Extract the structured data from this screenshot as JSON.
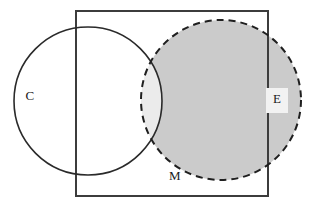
{
  "figure": {
    "type": "venn-diagram",
    "title": "",
    "background_color": "#ffffff",
    "width": 311,
    "height": 213
  },
  "universe": {
    "name": "universal-set-rectangle",
    "label": "",
    "x": 76,
    "y": 11,
    "width": 192,
    "height": 185,
    "stroke_color": "#3c3c3c",
    "stroke_width": 2,
    "fill": "none"
  },
  "sets": [
    {
      "id": "C",
      "label": "C",
      "shape": "circle",
      "cx": 88,
      "cy": 101,
      "r": 74,
      "stroke_color": "#2a2a2a",
      "stroke_width": 1.6,
      "stroke_style": "solid",
      "fill": "none",
      "label_x": 30,
      "label_y": 97
    },
    {
      "id": "M",
      "label": "M",
      "shape": "circle",
      "cx": 221,
      "cy": 100,
      "r": 80,
      "stroke_color": "#1f1f1f",
      "stroke_width": 2,
      "stroke_style": "dashed",
      "dash_pattern": "7 5",
      "fill": "#cbcbcb",
      "label_x": 175,
      "label_y": 177
    }
  ],
  "regions": [
    {
      "id": "C-and-M",
      "name": "intersection-lens",
      "fill": "#ebebeb",
      "description": "overlap of C and M"
    },
    {
      "id": "M-only",
      "name": "m-shaded-region",
      "fill": "#cbcbcb",
      "description": "M outside of C"
    },
    {
      "id": "C-only",
      "name": "c-unshaded-region",
      "fill": "#ffffff",
      "description": "C outside of M"
    }
  ],
  "labels": [
    {
      "id": "label-C",
      "text": "C",
      "x": 30,
      "y": 97,
      "boxed": false,
      "box_fill": "none"
    },
    {
      "id": "label-M",
      "text": "M",
      "x": 175,
      "y": 177,
      "boxed": false,
      "box_fill": "none"
    },
    {
      "id": "label-E",
      "text": "E",
      "x": 277,
      "y": 100,
      "boxed": true,
      "box_fill": "#f2f2f2",
      "box_x": 266,
      "box_y": 88,
      "box_width": 22,
      "box_height": 25
    }
  ],
  "colors": {
    "background": "#ffffff",
    "shade_dark": "#cbcbcb",
    "shade_light": "#ebebeb",
    "stroke_solid": "#2a2a2a",
    "stroke_dashed": "#1f1f1f",
    "stroke_rect": "#3c3c3c",
    "label_text": "#1a1a1a",
    "label_box": "#f2f2f2"
  }
}
